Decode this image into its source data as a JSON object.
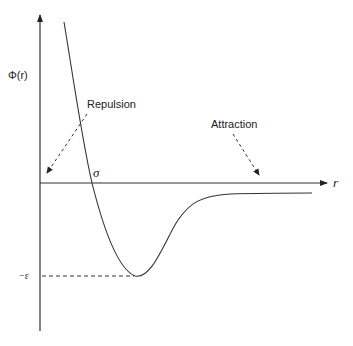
{
  "diagram": {
    "y_axis_label": "Φ(r)",
    "x_axis_label": "r",
    "sigma_label": "σ",
    "epsilon_label": "−ε",
    "annotations": [
      {
        "label": "Repulsion",
        "arrow": "dashed"
      },
      {
        "label": "Attraction",
        "arrow": "dashed"
      }
    ],
    "colors": {
      "line": "#333333",
      "background": "#ffffff"
    }
  }
}
